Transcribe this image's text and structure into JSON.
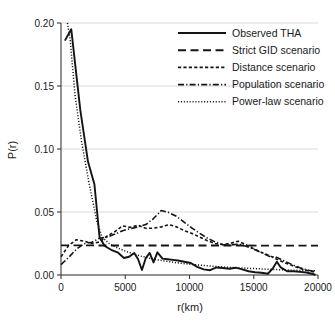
{
  "chart_data": {
    "type": "line",
    "title": "",
    "xlabel": "r(km)",
    "ylabel": "P(r)",
    "xlim": [
      0,
      20000
    ],
    "ylim": [
      0.0,
      0.2
    ],
    "xticks": [
      0,
      5000,
      10000,
      15000,
      20000
    ],
    "xtick_labels": [
      "0",
      "5000",
      "10000",
      "15000",
      "20000"
    ],
    "yticks": [
      0.0,
      0.05,
      0.1,
      0.15,
      0.2
    ],
    "ytick_labels": [
      "0.00",
      "0.05",
      "0.10",
      "0.15",
      "0.20"
    ],
    "grid": "horizontal",
    "legend_position": "top-right",
    "series": [
      {
        "name": "Observed THA",
        "style": "solid",
        "color": "#141414",
        "x": [
          300,
          800,
          1500,
          2100,
          2600,
          3000,
          3400,
          3900,
          4400,
          4900,
          5300,
          5700,
          6000,
          6300,
          6600,
          6900,
          7200,
          7500,
          7900,
          8300,
          8700,
          9100,
          9600,
          10100,
          10600,
          11100,
          11600,
          12100,
          12600,
          13100,
          13600,
          14100,
          14600,
          15100,
          15600,
          16100,
          16500,
          16800,
          17100,
          17600,
          18100,
          18600,
          19100,
          19600,
          19800
        ],
        "y": [
          0.186,
          0.195,
          0.131,
          0.09,
          0.072,
          0.03,
          0.023,
          0.02,
          0.018,
          0.0135,
          0.0145,
          0.0175,
          0.0125,
          0.004,
          0.0135,
          0.0175,
          0.01,
          0.018,
          0.013,
          0.0125,
          0.012,
          0.0115,
          0.0105,
          0.0095,
          0.0065,
          0.0045,
          0.0038,
          0.006,
          0.0055,
          0.005,
          0.0058,
          0.0045,
          0.003,
          0.0022,
          0.0018,
          0.001,
          0.0055,
          0.0105,
          0.006,
          0.003,
          0.003,
          0.0025,
          0.002,
          0.0008,
          0.0
        ]
      },
      {
        "name": "Strict GID scenario",
        "style": "dashed-long",
        "color": "#141414",
        "x": [
          0,
          20000
        ],
        "y": [
          0.0235,
          0.0233
        ]
      },
      {
        "name": "Distance scenario",
        "style": "dashed-short",
        "color": "#141414",
        "x": [
          0,
          600,
          1200,
          1800,
          2400,
          3000,
          3600,
          4200,
          4800,
          5400,
          6000,
          6600,
          7200,
          7800,
          8400,
          9000,
          9600,
          10200,
          10800,
          11400,
          12000,
          12600,
          13200,
          13800,
          14400,
          15000,
          15600,
          16200,
          16800,
          17400,
          18000,
          18600,
          19200,
          19800
        ],
        "y": [
          0.0145,
          0.0235,
          0.028,
          0.0268,
          0.025,
          0.0262,
          0.031,
          0.0345,
          0.039,
          0.0378,
          0.0395,
          0.037,
          0.0372,
          0.0382,
          0.04,
          0.0382,
          0.0352,
          0.033,
          0.03,
          0.0272,
          0.025,
          0.024,
          0.0252,
          0.0268,
          0.024,
          0.0208,
          0.018,
          0.0155,
          0.0125,
          0.0098,
          0.0075,
          0.0052,
          0.0035,
          0.0022
        ]
      },
      {
        "name": "Population scenario",
        "style": "dash-dot",
        "color": "#141414",
        "x": [
          0,
          600,
          1200,
          1800,
          2400,
          3000,
          3600,
          4200,
          4800,
          5400,
          6000,
          6600,
          7200,
          7800,
          8400,
          9000,
          9600,
          10200,
          10800,
          11400,
          12000,
          12600,
          13200,
          13800,
          14400,
          15000,
          15600,
          16200,
          16800,
          17400,
          18000,
          18600,
          19200,
          19800
        ],
        "y": [
          0.0082,
          0.014,
          0.0205,
          0.0248,
          0.026,
          0.0292,
          0.03,
          0.0325,
          0.0352,
          0.0368,
          0.0382,
          0.04,
          0.0448,
          0.0512,
          0.0495,
          0.0465,
          0.0418,
          0.0372,
          0.033,
          0.0292,
          0.0262,
          0.0242,
          0.0238,
          0.0245,
          0.0228,
          0.0205,
          0.0178,
          0.0148,
          0.014,
          0.011,
          0.0082,
          0.0058,
          0.0038,
          0.0028
        ]
      },
      {
        "name": "Power-law scenario",
        "style": "dotted",
        "color": "#141414",
        "x": [
          500,
          700,
          1100,
          1600,
          2200,
          2800,
          3200,
          3800,
          4400,
          5000,
          5600,
          6200,
          6800,
          7400,
          8000,
          8800,
          9600,
          10400,
          11200,
          12000,
          12800,
          13600,
          14400,
          15200,
          16000,
          16800,
          17600,
          18400,
          19200,
          19800
        ],
        "y": [
          0.2,
          0.188,
          0.142,
          0.106,
          0.072,
          0.042,
          0.03,
          0.0245,
          0.0215,
          0.019,
          0.0168,
          0.015,
          0.0135,
          0.0122,
          0.0112,
          0.01,
          0.009,
          0.0082,
          0.0075,
          0.0068,
          0.0062,
          0.0058,
          0.0054,
          0.005,
          0.0046,
          0.0043,
          0.004,
          0.0037,
          0.0035,
          0.0034
        ]
      }
    ]
  },
  "legend": {
    "items": [
      {
        "label": "Observed THA"
      },
      {
        "label": "Strict GID scenario"
      },
      {
        "label": "Distance scenario"
      },
      {
        "label": "Population scenario"
      },
      {
        "label": "Power-law scenario"
      }
    ]
  }
}
